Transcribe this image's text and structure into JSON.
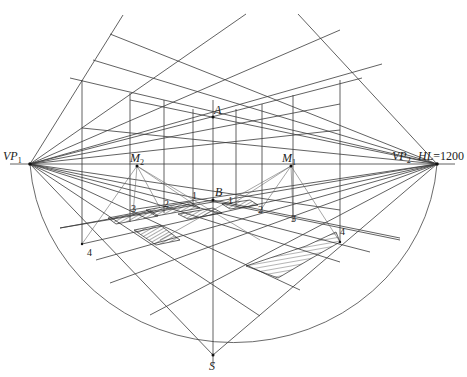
{
  "diagram": {
    "labels": {
      "vp1": "VP",
      "vp1_sub": "1",
      "vp2": "VP",
      "vp2_sub": "2",
      "m1": "M",
      "m1_sub": "1",
      "m2": "M",
      "m2_sub": "2",
      "a": "A",
      "b": "B",
      "s": "S",
      "hl": "HL",
      "hl_value": "=1200"
    },
    "measure_marks_left": [
      "4",
      "3",
      "2",
      "1"
    ],
    "measure_marks_right": [
      "1",
      "2",
      "3",
      "4"
    ],
    "points": {
      "VP1": [
        30,
        164
      ],
      "VP2": [
        437,
        164
      ],
      "M2": [
        137,
        166
      ],
      "M1": [
        291,
        166
      ],
      "A": [
        213,
        117
      ],
      "B": [
        213,
        200
      ],
      "S": [
        213,
        355
      ]
    },
    "colors": {
      "line": "#3a3a3a",
      "background": "#ffffff",
      "text": "#222222"
    }
  }
}
